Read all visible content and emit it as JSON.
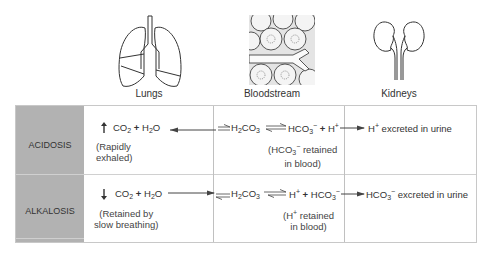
{
  "organs": [
    {
      "name": "lungs",
      "label": "Lungs"
    },
    {
      "name": "bloodstream",
      "label": "Bloodstream"
    },
    {
      "name": "kidneys",
      "label": "Kidneys"
    }
  ],
  "rows": [
    {
      "label": "ACIDOSIS",
      "lungs_direction": "up",
      "lungs_note_1": "(Rapidly",
      "lungs_note_2": "exhaled)",
      "blood_note_1": "retained",
      "blood_note_2": "in blood)",
      "kidney_text": "excreted in urine"
    },
    {
      "label": "ALKALOSIS",
      "lungs_direction": "down",
      "lungs_note_1": "(Retained by",
      "lungs_note_2": "slow breathing)",
      "blood_note_1": "retained",
      "blood_note_2": "in blood)",
      "kidney_text": "excreted in urine"
    }
  ],
  "chem": {
    "co2": "CO",
    "h2o_h": "H",
    "h2o_o": "O",
    "h2co3_h": "H",
    "h2co3_co": "CO",
    "hco3": "HCO",
    "h": "H",
    "two": "2",
    "three": "3",
    "plus_sign": "+",
    "minus_sign": "−",
    "open_paren": "("
  },
  "colors": {
    "label_bg": "#b2b2b2",
    "border": "#c8c8c8",
    "text": "#333333"
  }
}
